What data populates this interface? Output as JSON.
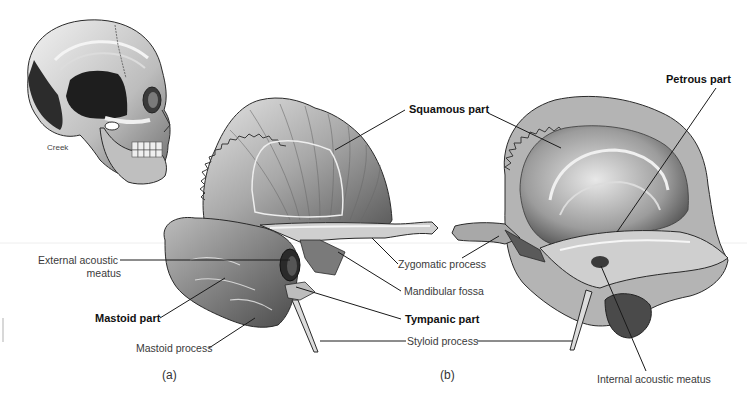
{
  "figure": {
    "skull_inset": {
      "label": "Creek"
    },
    "panels": [
      {
        "id": "a",
        "label": "(a)"
      },
      {
        "id": "b",
        "label": "(b)"
      }
    ],
    "labels": {
      "squamous_part": "Squamous part",
      "petrous_part": "Petrous part",
      "external_acoustic_meatus_line1": "External acoustic",
      "external_acoustic_meatus_line2": "meatus",
      "zygomatic_process": "Zygomatic process",
      "mandibular_fossa": "Mandibular fossa",
      "mastoid_part": "Mastoid part",
      "tympanic_part": "Tympanic part",
      "mastoid_process": "Mastoid process",
      "styloid_process": "Styloid process",
      "internal_acoustic_meatus": "Internal acoustic meatus"
    },
    "bold_labels": [
      "Squamous part",
      "Petrous part",
      "Mastoid part",
      "Tympanic part"
    ],
    "colors": {
      "background": "#ffffff",
      "leader_line": "#1a1a1a",
      "bone_light": "#d9d9d9",
      "bone_mid": "#9a9a9a",
      "bone_dark": "#3c3c3c",
      "skull_dark": "#1e1e1e"
    }
  }
}
